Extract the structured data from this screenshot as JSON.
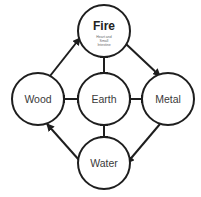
{
  "diagram": {
    "stroke_color": "#1e1e1e",
    "background": "#ffffff",
    "nodes": [
      {
        "id": "fire",
        "label": "Fire",
        "sublabel_lines": [
          "Heart and",
          "Small",
          "Intestine"
        ],
        "cx": 104,
        "cy": 31,
        "r": 26
      },
      {
        "id": "wood",
        "label": "Wood",
        "cx": 38,
        "cy": 99,
        "r": 26
      },
      {
        "id": "earth",
        "label": "Earth",
        "cx": 104,
        "cy": 99,
        "r": 26
      },
      {
        "id": "metal",
        "label": "Metal",
        "cx": 168,
        "cy": 99,
        "r": 26
      },
      {
        "id": "water",
        "label": "Water",
        "cx": 104,
        "cy": 163,
        "r": 26
      }
    ],
    "arrows": [
      {
        "from": "wood",
        "to": "fire"
      },
      {
        "from": "fire",
        "to": "metal"
      },
      {
        "from": "metal",
        "to": "water"
      },
      {
        "from": "water",
        "to": "wood"
      }
    ],
    "connectors": [
      {
        "from": "earth",
        "to": "fire"
      },
      {
        "from": "earth",
        "to": "wood"
      },
      {
        "from": "earth",
        "to": "metal"
      },
      {
        "from": "earth",
        "to": "water"
      }
    ]
  }
}
